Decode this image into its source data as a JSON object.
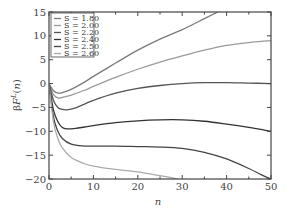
{
  "chart_data": {
    "type": "line",
    "title": "",
    "xlabel": "n",
    "ylabel": "βF^L(n)",
    "xlim": [
      0,
      50
    ],
    "ylim": [
      -20,
      15
    ],
    "xticks": [
      0,
      10,
      20,
      30,
      40,
      50
    ],
    "yticks": [
      -20,
      -15,
      -10,
      -5,
      0,
      5,
      10,
      15
    ],
    "grid": false,
    "legend_position": "upper left",
    "series": [
      {
        "name": "S = 1.80",
        "color": "#7a7a7a",
        "x": [
          0,
          1,
          2,
          3,
          5,
          8,
          10,
          15,
          20,
          25,
          30,
          35,
          38
        ],
        "values": [
          0,
          -1.5,
          -2,
          -1.9,
          -1.2,
          0.3,
          1.5,
          4.3,
          7,
          9.3,
          11.3,
          13.6,
          15
        ]
      },
      {
        "name": "S = 2.00",
        "color": "#9a9a9a",
        "x": [
          0,
          1,
          2,
          3,
          5,
          8,
          10,
          15,
          20,
          25,
          30,
          35,
          40,
          45,
          50
        ],
        "values": [
          0,
          -2.3,
          -3,
          -2.9,
          -2.4,
          -1.4,
          -0.6,
          1.3,
          3,
          4.5,
          5.8,
          7,
          8,
          8.6,
          9
        ]
      },
      {
        "name": "S = 2.20",
        "color": "#555555",
        "x": [
          0,
          1,
          2,
          3,
          4,
          6,
          8,
          10,
          15,
          20,
          25,
          30,
          35,
          40,
          45,
          50
        ],
        "values": [
          0,
          -3.5,
          -5,
          -5.4,
          -5.5,
          -5.1,
          -4.3,
          -3.5,
          -2,
          -1,
          -0.4,
          0,
          0.2,
          0.2,
          0.1,
          0
        ]
      },
      {
        "name": "S = 2.40",
        "color": "#333333",
        "x": [
          0,
          1,
          2,
          3,
          4,
          6,
          8,
          10,
          15,
          20,
          25,
          30,
          35,
          40,
          45,
          50
        ],
        "values": [
          0,
          -5.5,
          -8,
          -9.2,
          -9.5,
          -9.4,
          -9.1,
          -8.8,
          -8.2,
          -7.8,
          -7.6,
          -7.6,
          -7.9,
          -8.5,
          -9.2,
          -10
        ]
      },
      {
        "name": "S = 2.50",
        "color": "#444444",
        "x": [
          0,
          1,
          2,
          3,
          5,
          8,
          10,
          15,
          20,
          25,
          30,
          35,
          40,
          45,
          48,
          50
        ],
        "values": [
          0,
          -7,
          -10,
          -11.5,
          -12.7,
          -13.1,
          -13.1,
          -13.1,
          -13.2,
          -13.3,
          -13.6,
          -14.4,
          -15.8,
          -17.8,
          -19.2,
          -20
        ]
      },
      {
        "name": "S = 2.60",
        "color": "#aaaaaa",
        "x": [
          0,
          1,
          2,
          3,
          5,
          8,
          10,
          15,
          20,
          25,
          29
        ],
        "values": [
          0,
          -8,
          -11.5,
          -13.5,
          -15.5,
          -16.8,
          -17.3,
          -18,
          -18.5,
          -19.3,
          -20
        ]
      }
    ]
  }
}
